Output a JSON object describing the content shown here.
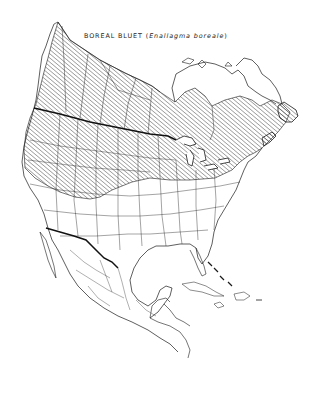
{
  "map": {
    "title_common": "BOREAL BLUET",
    "title_open": " (",
    "title_scientific": "Enallagma boreale",
    "title_close": ")",
    "region": "North America",
    "range_fill_style": "diagonal hatching",
    "legend": {
      "hatched_area": "Range of Boreal Bluet",
      "thick_line": "United States – Canada / Mexico border"
    },
    "colors": {
      "background": "#ffffff",
      "line": "#1a1a1a",
      "hatch": "#3a3a3a"
    }
  }
}
